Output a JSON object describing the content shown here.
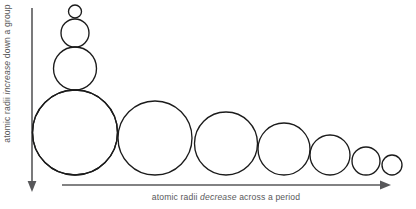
{
  "diagram": {
    "background_color": "#ffffff",
    "circle_stroke_color": "#1b1b1b",
    "axis_color": "#58585a",
    "text_color": "#58585a"
  },
  "vertical_axis": {
    "name": "atomic-radii-group-axis",
    "label_prefix": "atomic radii ",
    "label_emphasis": "increase",
    "label_suffix": " down a group",
    "full_label": "atomic radii increase down a group",
    "direction": "down",
    "arrow_icon": "arrow-down-icon"
  },
  "horizontal_axis": {
    "name": "atomic-radii-period-axis",
    "label_prefix": "atomic radii ",
    "label_emphasis": "decrease",
    "label_suffix": " across a period",
    "full_label": "atomic radii decrease across a period",
    "direction": "right",
    "arrow_icon": "arrow-right-icon"
  },
  "chart_data": {
    "type": "scatter",
    "xlabel": "atomic radii decrease across a period",
    "ylabel": "atomic radii increase down a group",
    "grid": false,
    "legend": "none",
    "units": "pixel diameter (relative atomic radius)",
    "series": [
      {
        "name": "group-column",
        "description": "Circles stacked vertically showing atomic radii increasing down a group",
        "orientation": "vertical",
        "points": [
          {
            "index": 1,
            "cx": 75,
            "cy": 11.5,
            "diameter": 13,
            "radius": 6.5
          },
          {
            "index": 2,
            "cx": 75,
            "cy": 33,
            "diameter": 28,
            "radius": 14
          },
          {
            "index": 3,
            "cx": 75,
            "cy": 68.5,
            "diameter": 43,
            "radius": 21.5
          },
          {
            "index": 4,
            "cx": 75,
            "cy": 132.5,
            "diameter": 85,
            "radius": 42.5
          }
        ]
      },
      {
        "name": "period-row",
        "description": "Circles in a row showing atomic radii decreasing across a period",
        "orientation": "horizontal",
        "points": [
          {
            "index": 1,
            "cx": 75,
            "cy": 132.5,
            "diameter": 85,
            "radius": 42.5
          },
          {
            "index": 2,
            "cx": 155,
            "cy": 138,
            "diameter": 74,
            "radius": 37
          },
          {
            "index": 3,
            "cx": 226,
            "cy": 143.5,
            "diameter": 63,
            "radius": 31.5
          },
          {
            "index": 4,
            "cx": 284,
            "cy": 149,
            "diameter": 52,
            "radius": 26
          },
          {
            "index": 5,
            "cx": 330,
            "cy": 155,
            "diameter": 40,
            "radius": 20
          },
          {
            "index": 6,
            "cx": 366,
            "cy": 161,
            "diameter": 28,
            "radius": 14
          },
          {
            "index": 7,
            "cx": 392,
            "cy": 165,
            "diameter": 20,
            "radius": 10
          }
        ]
      }
    ]
  }
}
